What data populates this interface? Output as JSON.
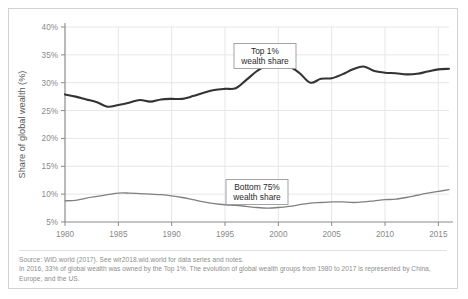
{
  "chart_data": {
    "type": "line",
    "title": "",
    "xlabel": "",
    "ylabel": "Share of global wealth (%)",
    "xlim": [
      1980,
      2016
    ],
    "ylim": [
      5,
      40
    ],
    "ytick_labels": [
      "5%",
      "10%",
      "15%",
      "20%",
      "25%",
      "30%",
      "35%",
      "40%"
    ],
    "ytick_values": [
      5,
      10,
      15,
      20,
      25,
      30,
      35,
      40
    ],
    "xtick_labels": [
      "1980",
      "1985",
      "1990",
      "1995",
      "2000",
      "2005",
      "2010",
      "2015"
    ],
    "xtick_values": [
      1980,
      1985,
      1990,
      1995,
      2000,
      2005,
      2010,
      2015
    ],
    "grid": true,
    "legend_position": "inline-annotations",
    "x": [
      1980,
      1981,
      1982,
      1983,
      1984,
      1985,
      1986,
      1987,
      1988,
      1989,
      1990,
      1991,
      1992,
      1993,
      1994,
      1995,
      1996,
      1997,
      1998,
      1999,
      2000,
      2001,
      2002,
      2003,
      2004,
      2005,
      2006,
      2007,
      2008,
      2009,
      2010,
      2011,
      2012,
      2013,
      2014,
      2015,
      2016
    ],
    "series": [
      {
        "name": "Top 1% wealth share",
        "color": "#333333",
        "width": 2.1,
        "values": [
          27.9,
          27.5,
          27.0,
          26.5,
          25.7,
          26.0,
          26.4,
          26.9,
          26.6,
          27.0,
          27.1,
          27.1,
          27.6,
          28.2,
          28.7,
          28.9,
          29.0,
          30.5,
          32.1,
          33.2,
          32.9,
          32.9,
          31.7,
          30.0,
          30.7,
          30.8,
          31.5,
          32.4,
          32.9,
          32.1,
          31.8,
          31.7,
          31.5,
          31.6,
          32.0,
          32.4,
          32.5
        ]
      },
      {
        "name": "Bottom 75% wealth share",
        "color": "#808080",
        "width": 1.3,
        "values": [
          8.8,
          8.9,
          9.3,
          9.6,
          9.9,
          10.2,
          10.2,
          10.1,
          10.0,
          9.9,
          9.7,
          9.4,
          9.0,
          8.6,
          8.3,
          8.1,
          8.0,
          7.8,
          7.6,
          7.5,
          7.6,
          7.8,
          8.1,
          8.4,
          8.5,
          8.6,
          8.6,
          8.5,
          8.6,
          8.8,
          9.0,
          9.1,
          9.4,
          9.8,
          10.2,
          10.5,
          10.8
        ]
      }
    ],
    "annotations": [
      {
        "name": "top1-label",
        "line1": "Top 1%",
        "line2": "wealth share",
        "x_px": 256,
        "y_px": 47
      },
      {
        "name": "bottom75-label",
        "line1": "Bottom 75%",
        "line2": "wealth share",
        "x_px": 248,
        "y_px": 183
      }
    ]
  },
  "footer": {
    "source_line": "Source:  WID.world (2017). See wir2018.wid.world for data series and notes.",
    "note_line": "In 2016, 33% of global wealth was owned by the Top 1%. The evolution of global wealth groups from 1980 to 2017 is represented by China, Europe, and the US."
  },
  "colors": {
    "top1_line": "#333333",
    "bottom75_line": "#808080",
    "grid": "#e4e4e4",
    "axis": "#8a8a8a",
    "card_border": "#d2d2d2",
    "tick_text": "#8a8a8a",
    "note_text": "#8d8d8d"
  }
}
